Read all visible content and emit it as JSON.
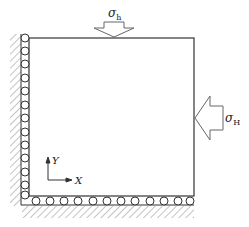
{
  "diagram": {
    "type": "boundary-condition-schematic",
    "labels": {
      "top_stress": "σ",
      "top_stress_sub": "h",
      "right_stress": "σ",
      "right_stress_sub": "H",
      "axis_x": "X",
      "axis_y": "Y"
    },
    "domain_box": {
      "x": 29,
      "y": 38,
      "width": 165,
      "height": 158
    },
    "left_rollers_count": 13,
    "bottom_rollers_count": 12,
    "colors": {
      "line": "#333333",
      "hatch": "#888888",
      "arrow": "#666666"
    }
  }
}
